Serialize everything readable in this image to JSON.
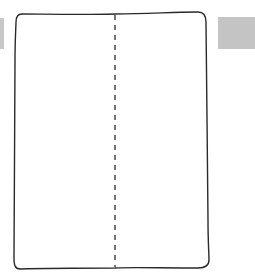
{
  "canvas": {
    "width": 255,
    "height": 278,
    "background": "#ffffff"
  },
  "panels": {
    "left_tab": {
      "color": "#c8c8c8"
    },
    "right_tab": {
      "color": "#c4c4c4"
    }
  },
  "card": {
    "stroke": "#2a2a2a",
    "divider": {
      "style": "dashed",
      "orientation": "vertical"
    }
  }
}
